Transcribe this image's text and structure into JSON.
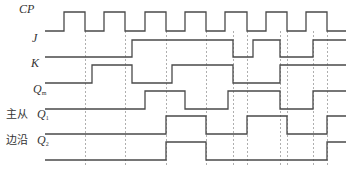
{
  "diagram": {
    "signals": [
      {
        "id": "cp",
        "label": "CP",
        "sub": "",
        "high_y": 12,
        "low_y": 31,
        "transitions": [
          45,
          64,
          85,
          104,
          125,
          145,
          166,
          185,
          206,
          225,
          247,
          266,
          287,
          306,
          327,
          346
        ],
        "start": "low"
      },
      {
        "id": "j",
        "label": "J",
        "sub": "",
        "high_y": 40,
        "low_y": 57,
        "transitions": [
          45,
          132,
          233,
          253,
          280,
          313,
          346
        ],
        "start": "low"
      },
      {
        "id": "k",
        "label": "K",
        "sub": "",
        "high_y": 65,
        "low_y": 83,
        "transitions": [
          45,
          92,
          132,
          172,
          233,
          280,
          346
        ],
        "start": "low"
      },
      {
        "id": "qm",
        "label": "Q",
        "sub": "m",
        "high_y": 91,
        "low_y": 109,
        "transitions": [
          45,
          145,
          185,
          228,
          280,
          313,
          346
        ],
        "start": "low"
      },
      {
        "id": "q1",
        "label": "Q",
        "sub": "1",
        "prefix": "主从",
        "high_y": 116,
        "low_y": 134,
        "transitions": [
          45,
          166,
          206,
          247,
          287,
          327,
          346
        ],
        "start": "low"
      },
      {
        "id": "q2",
        "label": "Q",
        "sub": "2",
        "prefix": "边沿",
        "high_y": 142,
        "low_y": 160,
        "transitions": [
          45,
          166,
          206,
          327,
          346
        ],
        "start": "low"
      }
    ],
    "dashed_lines_x": [
      85,
      125,
      166,
      206,
      233,
      247,
      280,
      287,
      313,
      327
    ],
    "dashed_top": 31,
    "dashed_bottom": 166,
    "colors": {
      "wave": "#4a4a4a",
      "dash": "#9a9a9a"
    }
  },
  "labels": {
    "cp": "CP",
    "j": "J",
    "k": "K",
    "qm_main": "Q",
    "qm_sub": "m",
    "q1_main": "Q",
    "q1_sub": "1",
    "q2_main": "Q",
    "q2_sub": "2",
    "q1_prefix": "主从",
    "q2_prefix": "边沿"
  }
}
